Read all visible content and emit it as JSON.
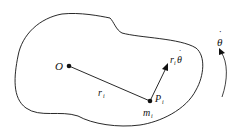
{
  "diagram": {
    "labels": {
      "origin": "O",
      "radius": "r",
      "radius_sub": "i",
      "point": "P",
      "point_sub": "i",
      "mass": "m",
      "mass_sub": "i",
      "velocity_r": "r",
      "velocity_sub": "i",
      "velocity_theta": "θ",
      "angular_velocity": "θ",
      "dot": "˙"
    },
    "colors": {
      "stroke": "#111111",
      "background": "#ffffff"
    }
  }
}
